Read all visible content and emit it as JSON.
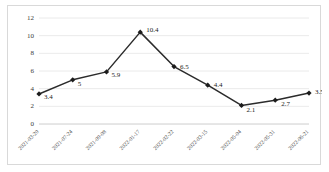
{
  "chart_data": {
    "type": "line",
    "title": "",
    "subtitle": "",
    "xlabel": "",
    "ylabel": "",
    "ylim": [
      0,
      12
    ],
    "yticks": [
      "0",
      "2",
      "4",
      "6",
      "8",
      "10",
      "12"
    ],
    "grid": true,
    "legend": false,
    "legend_position": "none",
    "marker": "diamond",
    "line_color": "#2b2b2b",
    "marker_color": "#1c1c1c",
    "gridline_color": "#e4e4e4",
    "border_color": "#d9d9d9",
    "categories": [
      "2021-03-20",
      "2021-07-24",
      "2021-09-08",
      "2022-01-17",
      "2022-02-22",
      "2022-03-15",
      "2022-05-04",
      "2022-05-31",
      "2022-06-21"
    ],
    "values": [
      3.4,
      5,
      5.9,
      10.4,
      6.5,
      4.4,
      2.1,
      2.7,
      3.5
    ],
    "data_labels": [
      "3.4",
      "5",
      "5.9",
      "10.4",
      "6.5",
      "4.4",
      "2.1",
      "2.7",
      "3.5"
    ]
  }
}
